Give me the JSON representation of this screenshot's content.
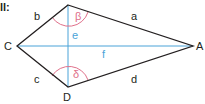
{
  "header": {
    "label": "ll:"
  },
  "figure": {
    "type": "kite",
    "vertices": {
      "A": "A",
      "B": "",
      "C": "C",
      "D": "D"
    },
    "sides": {
      "a": "a",
      "b": "b",
      "c": "c",
      "d": "d"
    },
    "diagonals": {
      "e": "e",
      "f": "f"
    },
    "angles": {
      "beta": "β",
      "delta": "δ"
    },
    "colors": {
      "outline": "#231f20",
      "diagonal": "#4aa3d8",
      "angle": "#e0708a"
    }
  }
}
